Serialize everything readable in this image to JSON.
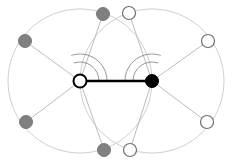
{
  "figure": {
    "width": 235,
    "height": 163,
    "background_color": "#ffffff"
  },
  "colors": {
    "black": "#000000",
    "gray_node": "#808080",
    "white_node": "#ffffff",
    "node_stroke_dark": "#1a1a1a",
    "node_stroke_light": "#6e6e6e",
    "spoke_stroke": "#b4b4b4",
    "circle_stroke": "#cfcfcf",
    "arc_stroke": "#8a8a8a",
    "main_edge": "#000000"
  },
  "geometry": {
    "hub_left": {
      "cx": 80,
      "cy": 81,
      "r": 6.5
    },
    "hub_right": {
      "cx": 152,
      "cy": 81,
      "r": 6.5
    },
    "orbit_radius": 72,
    "peripheral_radius": 6.5
  },
  "nodes": [
    {
      "id": "hub-left",
      "label": "left hub",
      "cx": 80,
      "cy": 81,
      "r": 6.5,
      "fill": "#ffffff",
      "stroke": "#000000",
      "stroke_width": 2.0,
      "kind": "hub-hollow"
    },
    {
      "id": "hub-right",
      "label": "right hub",
      "cx": 152,
      "cy": 81,
      "r": 6.5,
      "fill": "#000000",
      "stroke": "#000000",
      "stroke_width": 1.0,
      "kind": "hub-filled"
    },
    {
      "id": "gray-top",
      "label": "gray top",
      "cx": 103,
      "cy": 14,
      "r": 6.5,
      "fill": "#808080",
      "stroke": "#7a7a7a",
      "stroke_width": 1.0,
      "kind": "gray"
    },
    {
      "id": "gray-upper-left",
      "label": "gray upper left",
      "cx": 25,
      "cy": 41,
      "r": 6.5,
      "fill": "#808080",
      "stroke": "#7a7a7a",
      "stroke_width": 1.0,
      "kind": "gray"
    },
    {
      "id": "gray-lower-left",
      "label": "gray lower left",
      "cx": 26,
      "cy": 122,
      "r": 6.5,
      "fill": "#808080",
      "stroke": "#7a7a7a",
      "stroke_width": 1.0,
      "kind": "gray"
    },
    {
      "id": "gray-bottom",
      "label": "gray bottom",
      "cx": 104,
      "cy": 150,
      "r": 6.5,
      "fill": "#808080",
      "stroke": "#7a7a7a",
      "stroke_width": 1.0,
      "kind": "gray"
    },
    {
      "id": "white-top",
      "label": "white top",
      "cx": 129,
      "cy": 13,
      "r": 6.5,
      "fill": "#ffffff",
      "stroke": "#6e6e6e",
      "stroke_width": 1.2,
      "kind": "white"
    },
    {
      "id": "white-upper-right",
      "label": "white upper right",
      "cx": 208,
      "cy": 41,
      "r": 6.5,
      "fill": "#ffffff",
      "stroke": "#6e6e6e",
      "stroke_width": 1.2,
      "kind": "white"
    },
    {
      "id": "white-lower-right",
      "label": "white lower right",
      "cx": 207,
      "cy": 122,
      "r": 6.5,
      "fill": "#ffffff",
      "stroke": "#6e6e6e",
      "stroke_width": 1.2,
      "kind": "white"
    },
    {
      "id": "white-bottom",
      "label": "white bottom",
      "cx": 130,
      "cy": 150,
      "r": 6.5,
      "fill": "#ffffff",
      "stroke": "#6e6e6e",
      "stroke_width": 1.2,
      "kind": "white"
    }
  ],
  "edges": [
    {
      "id": "main-edge",
      "from": "hub-left",
      "to": "hub-right",
      "x1": 80,
      "y1": 81,
      "x2": 152,
      "y2": 81,
      "stroke": "#000000",
      "stroke_width": 2.4,
      "kind": "main"
    },
    {
      "id": "spoke-l-top",
      "from": "hub-left",
      "to": "gray-top",
      "x1": 80,
      "y1": 81,
      "x2": 103,
      "y2": 14,
      "stroke": "#b4b4b4",
      "stroke_width": 0.9,
      "kind": "spoke"
    },
    {
      "id": "spoke-l-ul",
      "from": "hub-left",
      "to": "gray-upper-left",
      "x1": 80,
      "y1": 81,
      "x2": 25,
      "y2": 41,
      "stroke": "#b4b4b4",
      "stroke_width": 0.9,
      "kind": "spoke"
    },
    {
      "id": "spoke-l-ll",
      "from": "hub-left",
      "to": "gray-lower-left",
      "x1": 80,
      "y1": 81,
      "x2": 26,
      "y2": 122,
      "stroke": "#b4b4b4",
      "stroke_width": 0.9,
      "kind": "spoke"
    },
    {
      "id": "spoke-l-bot",
      "from": "hub-left",
      "to": "gray-bottom",
      "x1": 80,
      "y1": 81,
      "x2": 104,
      "y2": 150,
      "stroke": "#b4b4b4",
      "stroke_width": 0.9,
      "kind": "spoke"
    },
    {
      "id": "spoke-r-top",
      "from": "hub-right",
      "to": "white-top",
      "x1": 152,
      "y1": 81,
      "x2": 129,
      "y2": 13,
      "stroke": "#b4b4b4",
      "stroke_width": 0.9,
      "kind": "spoke"
    },
    {
      "id": "spoke-r-ur",
      "from": "hub-right",
      "to": "white-upper-right",
      "x1": 152,
      "y1": 81,
      "x2": 208,
      "y2": 41,
      "stroke": "#b4b4b4",
      "stroke_width": 0.9,
      "kind": "spoke"
    },
    {
      "id": "spoke-r-lr",
      "from": "hub-right",
      "to": "white-lower-right",
      "x1": 152,
      "y1": 81,
      "x2": 207,
      "y2": 122,
      "stroke": "#b4b4b4",
      "stroke_width": 0.9,
      "kind": "spoke"
    },
    {
      "id": "spoke-r-bot",
      "from": "hub-right",
      "to": "white-bottom",
      "x1": 152,
      "y1": 81,
      "x2": 130,
      "y2": 150,
      "stroke": "#b4b4b4",
      "stroke_width": 0.9,
      "kind": "spoke"
    }
  ],
  "orbits": [
    {
      "id": "orbit-left",
      "label": "circle centered at left hub",
      "cx": 80,
      "cy": 81,
      "r": 72,
      "stroke": "#cfcfcf",
      "stroke_width": 1.0
    },
    {
      "id": "orbit-right",
      "label": "circle centered at right hub",
      "cx": 152,
      "cy": 81,
      "r": 72,
      "stroke": "#cfcfcf",
      "stroke_width": 1.0
    }
  ],
  "angle_arcs": [
    {
      "id": "arc-left-inner",
      "label": "left hub inner angle arc",
      "cx": 80,
      "cy": 81,
      "r": 19,
      "start_deg": 251,
      "end_deg": 360,
      "stroke": "#8a8a8a",
      "stroke_width": 0.9
    },
    {
      "id": "arc-left-outer",
      "label": "left hub outer angle arc",
      "cx": 80,
      "cy": 81,
      "r": 27,
      "start_deg": 251,
      "end_deg": 360,
      "stroke": "#8a8a8a",
      "stroke_width": 0.9
    },
    {
      "id": "arc-right-inner",
      "label": "right hub inner angle arc",
      "cx": 152,
      "cy": 81,
      "r": 19,
      "start_deg": 180,
      "end_deg": 289,
      "stroke": "#8a8a8a",
      "stroke_width": 0.9
    },
    {
      "id": "arc-right-outer",
      "label": "right hub outer angle arc",
      "cx": 152,
      "cy": 81,
      "r": 27,
      "start_deg": 180,
      "end_deg": 289,
      "stroke": "#8a8a8a",
      "stroke_width": 0.9
    }
  ]
}
